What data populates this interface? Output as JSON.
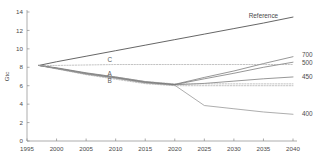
{
  "chart_data": {
    "type": "line",
    "title": "",
    "subtitle": "",
    "xlabel": "",
    "ylabel": "Gtc",
    "xlim": [
      1995,
      2040
    ],
    "ylim": [
      0,
      14
    ],
    "grid": false,
    "legend_position": "right-of-axis-inline",
    "x_ticks": [
      1995,
      2000,
      2005,
      2010,
      2015,
      2020,
      2025,
      2030,
      2035,
      2040
    ],
    "y_ticks": [
      0,
      2,
      4,
      6,
      8,
      10,
      12,
      14
    ],
    "x": [
      1997,
      2000,
      2005,
      2010,
      2015,
      2020,
      2025,
      2030,
      2035,
      2040
    ],
    "series": [
      {
        "name": "Reference",
        "label": "Reference",
        "color": "#555555",
        "width": 0.9,
        "dash": "none",
        "label_x": 2035,
        "label_y": 13.3,
        "values": [
          8.2,
          8.6,
          9.2,
          9.8,
          10.4,
          11.0,
          11.6,
          12.2,
          12.8,
          13.45
        ]
      },
      {
        "name": "700",
        "label": "700",
        "color": "#6a6a6a",
        "width": 0.7,
        "dash": "none",
        "label_x": 2041,
        "label_y": 9.35,
        "values": [
          8.2,
          7.95,
          7.4,
          6.95,
          6.45,
          6.15,
          6.9,
          7.6,
          8.4,
          9.15
        ]
      },
      {
        "name": "500",
        "label": "500",
        "color": "#6a6a6a",
        "width": 0.7,
        "dash": "none",
        "label_x": 2041,
        "label_y": 8.45,
        "values": [
          8.2,
          7.9,
          7.35,
          6.9,
          6.4,
          6.12,
          6.75,
          7.35,
          8.0,
          8.55
        ]
      },
      {
        "name": "450",
        "label": "450",
        "color": "#6a6a6a",
        "width": 0.7,
        "dash": "none",
        "label_x": 2041,
        "label_y": 7.0,
        "values": [
          8.2,
          7.88,
          7.3,
          6.85,
          6.35,
          6.1,
          6.25,
          6.5,
          6.75,
          6.95
        ]
      },
      {
        "name": "400",
        "label": "400",
        "color": "#8a8a8a",
        "width": 0.7,
        "dash": "none",
        "label_x": 2041,
        "label_y": 2.9,
        "values": [
          8.2,
          7.85,
          7.25,
          6.8,
          6.3,
          6.05,
          3.85,
          3.5,
          3.15,
          2.9
        ]
      },
      {
        "name": "C",
        "label": "C",
        "color": "#9a9a9a",
        "width": 0.6,
        "dash": "1.4,1.4",
        "label_x": 2009,
        "label_y": 8.55,
        "values": [
          8.2,
          8.2,
          8.25,
          8.3,
          8.3,
          8.3,
          8.3,
          8.3,
          8.3,
          8.3
        ]
      },
      {
        "name": "A",
        "label": "A",
        "color": "#9a9a9a",
        "width": 0.6,
        "dash": "1.4,1.4",
        "label_x": 2009,
        "label_y": 7.05,
        "values": [
          8.2,
          7.9,
          7.35,
          6.95,
          6.45,
          6.2,
          6.2,
          6.2,
          6.2,
          6.2
        ]
      },
      {
        "name": "B",
        "label": "B",
        "color": "#9a9a9a",
        "width": 0.6,
        "dash": "1.4,1.4",
        "label_x": 2009,
        "label_y": 6.25,
        "values": [
          8.2,
          7.82,
          7.2,
          6.7,
          6.22,
          6.0,
          6.0,
          6.0,
          6.0,
          6.0
        ]
      }
    ],
    "annotations": [
      {
        "text": "C",
        "x": 2009,
        "y": 8.55
      },
      {
        "text": "A",
        "x": 2009,
        "y": 7.05
      },
      {
        "text": "B",
        "x": 2009,
        "y": 6.25
      }
    ],
    "right_labels": [
      {
        "text": "700",
        "y": 9.35
      },
      {
        "text": "500",
        "y": 8.45
      },
      {
        "text": "450",
        "y": 7.0
      },
      {
        "text": "400",
        "y": 2.9
      }
    ]
  }
}
